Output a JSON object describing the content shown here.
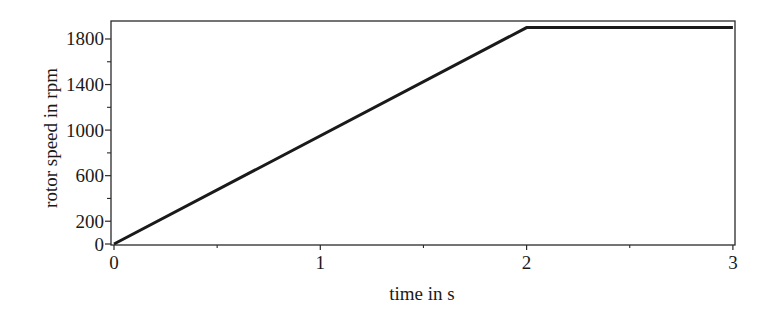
{
  "chart_data": {
    "type": "line",
    "title": "",
    "xlabel": "time in s",
    "ylabel": "rotor speed in rpm",
    "xlim": [
      0,
      3.01
    ],
    "ylim": [
      0,
      1950
    ],
    "x_ticks": [
      0,
      1,
      2,
      3
    ],
    "x_tick_labels": [
      "0",
      "1",
      "2",
      "3"
    ],
    "x_minor_ticks": [
      0.5,
      1.5,
      2.5
    ],
    "y_ticks": [
      0,
      200,
      600,
      1000,
      1400,
      1800
    ],
    "y_tick_labels": [
      "0",
      "200",
      "600",
      "1000",
      "1400",
      "1800"
    ],
    "y_minor_ticks": [
      400,
      800,
      1200,
      1600
    ],
    "grid": false,
    "legend": null,
    "series": [
      {
        "name": "rotor speed",
        "color": "#1a1a1a",
        "x": [
          0,
          2,
          3
        ],
        "y": [
          0,
          1900,
          1900
        ]
      }
    ]
  }
}
